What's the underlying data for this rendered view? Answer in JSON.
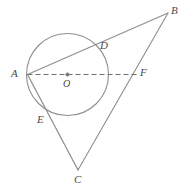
{
  "figure": {
    "kind": "geometry-diagram",
    "width": 181,
    "height": 196,
    "background_color": "#ffffff",
    "stroke_color": "#8a8a8a",
    "label_color": "#4a4a4a",
    "stroke_width": 1.1
  },
  "circle": {
    "name": "circle-O",
    "cx": 67.5,
    "cy": 74.5,
    "r": 41.0
  },
  "points": {
    "A": {
      "label": "A",
      "x": 27.5,
      "y": 74.5,
      "label_x": 11,
      "label_y": 70
    },
    "B": {
      "label": "B",
      "x": 168.0,
      "y": 13.0,
      "label_x": 172,
      "label_y": 6
    },
    "C": {
      "label": "C",
      "x": 78.0,
      "y": 170.0,
      "label_x": 74,
      "label_y": 175
    },
    "D": {
      "label": "D",
      "x": 98.5,
      "y": 45.5,
      "label_x": 101,
      "label_y": 42
    },
    "E": {
      "label": "E",
      "x": 48.0,
      "y": 112.0,
      "label_x": 38,
      "label_y": 116
    },
    "F": {
      "label": "F",
      "x": 137.0,
      "y": 74.5,
      "label_x": 140,
      "label_y": 69
    },
    "O": {
      "label": "O",
      "x": 67.5,
      "y": 74.5,
      "label_x": 63,
      "label_y": 78
    }
  },
  "segments": [
    {
      "name": "segment-AB",
      "from": "A",
      "to": "B",
      "style": "solid"
    },
    {
      "name": "segment-AC",
      "from": "A",
      "to": "C",
      "style": "solid"
    },
    {
      "name": "segment-BC",
      "from": "B",
      "to": "C",
      "style": "solid"
    },
    {
      "name": "segment-AF",
      "from": "A",
      "to": "F",
      "style": "dashed"
    }
  ],
  "markers": {
    "center_dot": {
      "name": "center-dot-O",
      "cx": 67.5,
      "cy": 74.5,
      "r": 1.6
    }
  },
  "dash_pattern": "5,3"
}
